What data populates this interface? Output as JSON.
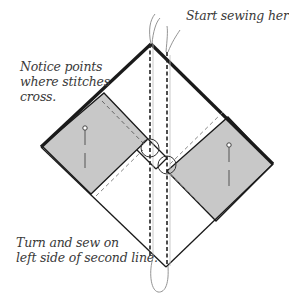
{
  "diagram": {
    "colors": {
      "fabric_gray": "#c8c8c8",
      "outline": "#1a1a1a",
      "thread": "#888888",
      "text": "#3a3a3a"
    },
    "annotations": {
      "start": "Start sewing here.",
      "notice_line1": "Notice points",
      "notice_line2": "where stitches",
      "notice_line3": "cross.",
      "turn_line1": "Turn and sew on",
      "turn_line2": "left side of second line."
    },
    "shapes": {
      "outer_diamond": "white background square rotated 45°",
      "left_square": "gray fabric square, upper-left",
      "right_square": "gray fabric square, lower-right",
      "stitch_lines": 2,
      "cross_circles": 2,
      "pins": 2
    }
  }
}
